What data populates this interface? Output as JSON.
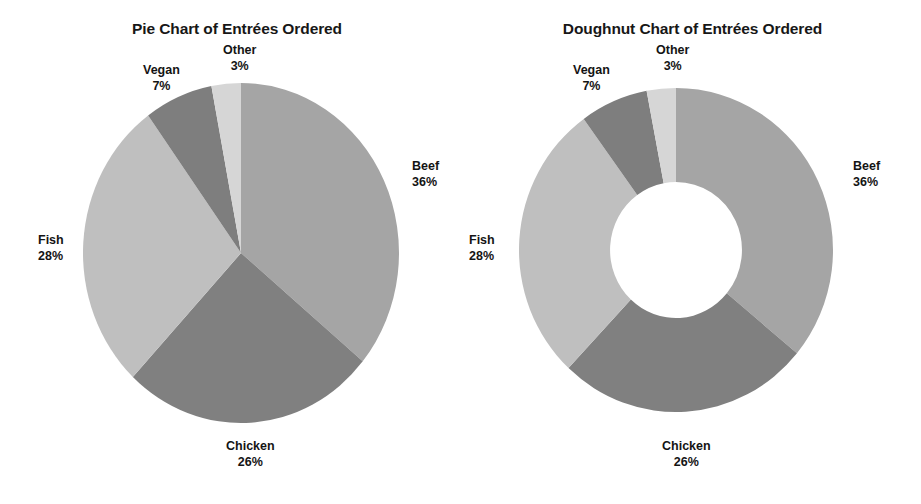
{
  "charts": [
    {
      "id": "pie",
      "title": "Pie Chart of Entrées Ordered",
      "type": "pie"
    },
    {
      "id": "doughnut",
      "title": "Doughnut Chart of Entrées Ordered",
      "type": "doughnut"
    }
  ],
  "labels": {
    "beef": {
      "name": "Beef",
      "pct": "36%"
    },
    "chicken": {
      "name": "Chicken",
      "pct": "26%"
    },
    "fish": {
      "name": "Fish",
      "pct": "28%"
    },
    "vegan": {
      "name": "Vegan",
      "pct": "7%"
    },
    "other": {
      "name": "Other",
      "pct": "3%"
    }
  },
  "chart_data": [
    {
      "type": "pie",
      "title": "Pie Chart of Entrées Ordered",
      "xlabel": "",
      "ylabel": "",
      "categories": [
        "Beef",
        "Chicken",
        "Fish",
        "Vegan",
        "Other"
      ],
      "values": [
        36,
        26,
        28,
        7,
        3
      ],
      "value_unit": "percent",
      "data_labels": [
        "36%",
        "26%",
        "28%",
        "7%",
        "3%"
      ],
      "colors": [
        "#A5A5A5",
        "#808080",
        "#BFBFBF",
        "#7E7E7E",
        "#D6D6D6"
      ],
      "start_angle_deg": 0,
      "direction": "clockwise",
      "legend": "none",
      "labels_position": "outside-callout",
      "grid": false,
      "hole_ratio": 0
    },
    {
      "type": "pie",
      "title": "Doughnut Chart of Entrées Ordered",
      "xlabel": "",
      "ylabel": "",
      "categories": [
        "Beef",
        "Chicken",
        "Fish",
        "Vegan",
        "Other"
      ],
      "values": [
        36,
        26,
        28,
        7,
        3
      ],
      "value_unit": "percent",
      "data_labels": [
        "36%",
        "26%",
        "28%",
        "7%",
        "3%"
      ],
      "colors": [
        "#A5A5A5",
        "#808080",
        "#BFBFBF",
        "#7E7E7E",
        "#D6D6D6"
      ],
      "start_angle_deg": 0,
      "direction": "clockwise",
      "legend": "none",
      "labels_position": "outside-callout",
      "grid": false,
      "hole_ratio": 0.42,
      "variant": "doughnut"
    }
  ],
  "palette": {
    "beef": "#A5A5A5",
    "chicken": "#808080",
    "fish": "#BFBFBF",
    "vegan": "#7E7E7E",
    "other": "#D6D6D6",
    "background": "#FFFFFF",
    "text": "#141414"
  }
}
